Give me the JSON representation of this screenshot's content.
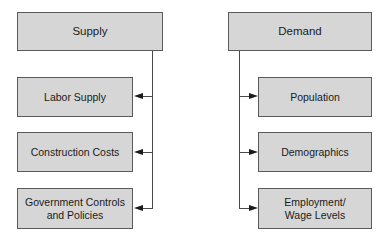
{
  "supply": {
    "title": "Supply",
    "children": [
      {
        "label": "Labor Supply"
      },
      {
        "label": "Construction Costs"
      },
      {
        "label": "Government Controls\nand Policies"
      }
    ]
  },
  "demand": {
    "title": "Demand",
    "children": [
      {
        "label": "Population"
      },
      {
        "label": "Demographics"
      },
      {
        "label": "Employment/\nWage Levels"
      }
    ]
  },
  "colors": {
    "box_fill": "#d6d6d6",
    "box_border": "#5a5a5a",
    "connector": "#4a4a4a"
  }
}
